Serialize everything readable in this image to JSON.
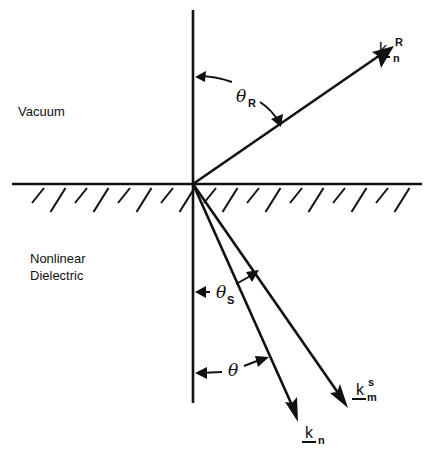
{
  "regions": {
    "upper": "Vacuum",
    "lower_line1": "Nonlinear",
    "lower_line2": "Dielectric"
  },
  "vectors": {
    "reflected": {
      "symbol": "k",
      "subscript": "n",
      "superscript": "R"
    },
    "scattered": {
      "symbol": "k",
      "subscript": "m",
      "superscript": "s"
    },
    "transmitted": {
      "symbol": "k",
      "subscript": "n",
      "superscript": ""
    }
  },
  "angles": {
    "reflected": {
      "symbol": "θ",
      "subscript": "R"
    },
    "scattered": {
      "symbol": "θ",
      "subscript": "S"
    },
    "transmitted": {
      "symbol": "θ",
      "subscript": ""
    }
  },
  "colors": {
    "ink": "#111111",
    "background": "#ffffff"
  }
}
